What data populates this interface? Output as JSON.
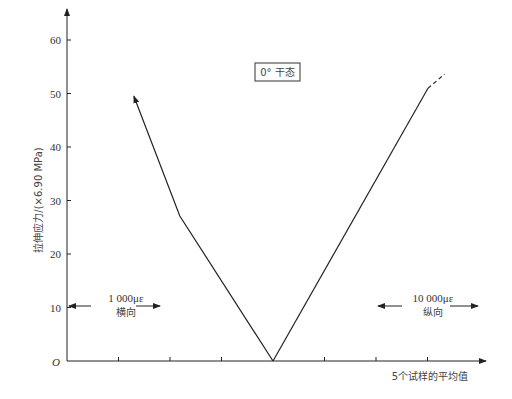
{
  "chart_data": {
    "type": "line",
    "title": "",
    "annotation_box": "0° 干态",
    "xlabel": "5个试样的平均值",
    "ylabel": "拉伸应力/(×6.90 MPa)",
    "origin_label": "O",
    "ylim": [
      0,
      60
    ],
    "yticks": [
      10,
      20,
      30,
      40,
      50,
      60
    ],
    "ytick_labels": [
      "10",
      "20",
      "30",
      "40",
      "50",
      "60"
    ],
    "x_divisions": {
      "left": 4,
      "right": 4
    },
    "grid": false,
    "legend": null,
    "scales": {
      "transverse": {
        "label_value": "1 000με",
        "label_dir": "横向",
        "strain_per_division": 1000,
        "side": "left"
      },
      "longitudinal": {
        "label_value": "10 000με",
        "label_dir": "纵向",
        "strain_per_division": 10000,
        "side": "right"
      }
    },
    "series": [
      {
        "name": "横向",
        "strain_microstrain": [
          0,
          1810,
          2700
        ],
        "stress": [
          0,
          27.1,
          49.5
        ],
        "end_marker": "arrow"
      },
      {
        "name": "纵向",
        "strain_microstrain": [
          0,
          30100
        ],
        "stress": [
          0,
          51.0
        ],
        "extension_dashed": {
          "strain_microstrain": [
            30100,
            33300
          ],
          "stress": [
            51.0,
            53.6
          ]
        }
      }
    ]
  }
}
